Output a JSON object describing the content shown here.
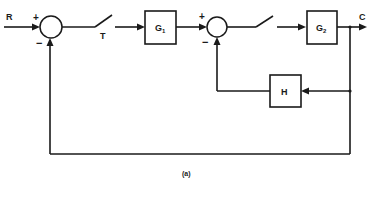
{
  "diagram": {
    "type": "block-diagram",
    "caption": "(a)",
    "input": {
      "label": "R"
    },
    "output": {
      "label": "C"
    },
    "summing_junctions": [
      {
        "id": "sum1",
        "plus_sign": "+",
        "minus_sign": "−"
      },
      {
        "id": "sum2",
        "plus_sign": "+",
        "minus_sign": "−"
      }
    ],
    "switches": [
      {
        "id": "sampler1",
        "label": "T"
      },
      {
        "id": "sampler2",
        "label": ""
      }
    ],
    "blocks": [
      {
        "id": "G1",
        "label": "G",
        "subscript": "1"
      },
      {
        "id": "G2",
        "label": "G",
        "subscript": "2"
      },
      {
        "id": "H",
        "label": "H",
        "subscript": ""
      }
    ],
    "connections": [
      "R -> sum1 (+)",
      "sum1 -> sampler1 (T)",
      "sampler1 -> G1",
      "G1 -> sum2 (+)",
      "sum2 -> sampler2",
      "sampler2 -> G2",
      "G2 -> C",
      "C -> H (feedback)",
      "H -> sum2 (-)",
      "C -> sum1 (-) (unity feedback)"
    ]
  }
}
